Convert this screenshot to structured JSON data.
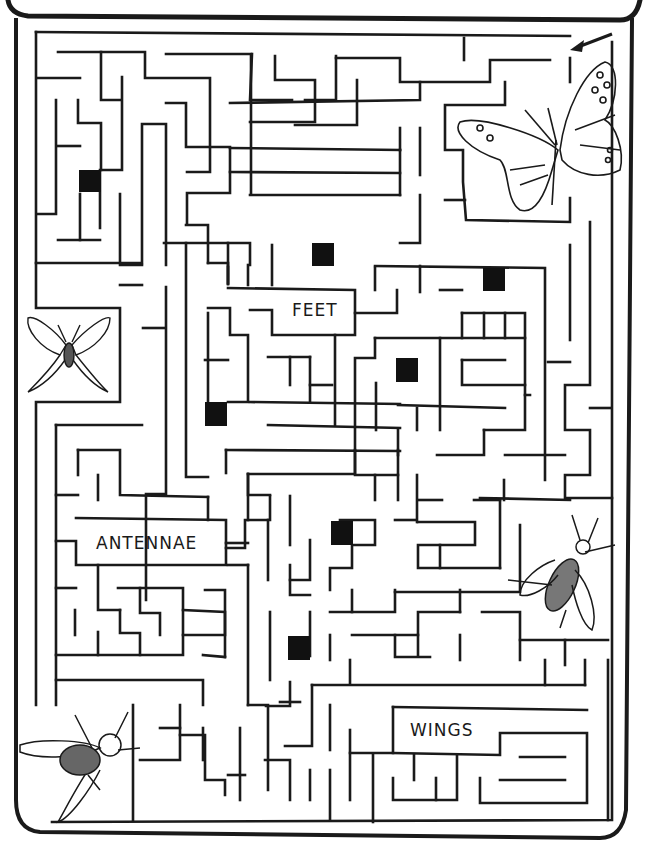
{
  "puzzle": {
    "type": "maze",
    "start_marker": "arrow-icon",
    "colors": {
      "ink": "#1a1a1a",
      "paper": "#ffffff",
      "checkpoint": "#111111"
    },
    "labels": {
      "feet": "FEET",
      "antennae": "ANTENNAE",
      "wings": "WINGS"
    },
    "illustrations": [
      "butterfly",
      "luna-moth",
      "bee",
      "fly"
    ],
    "checkpoints": [
      {
        "x": 80,
        "y": 170
      },
      {
        "x": 312,
        "y": 243
      },
      {
        "x": 483,
        "y": 268
      },
      {
        "x": 396,
        "y": 358
      },
      {
        "x": 205,
        "y": 403
      },
      {
        "x": 331,
        "y": 520
      },
      {
        "x": 288,
        "y": 636
      }
    ]
  }
}
